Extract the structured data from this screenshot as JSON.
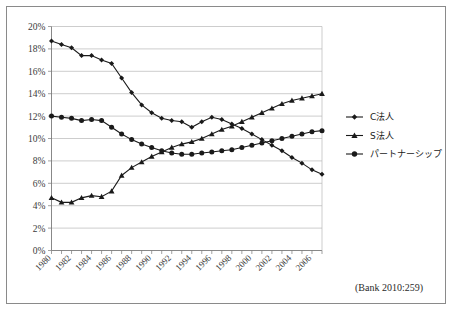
{
  "figure": {
    "source_note": "(Bank 2010:259)"
  },
  "chart_data": {
    "type": "line",
    "title": "",
    "xlabel": "",
    "ylabel": "",
    "grid": true,
    "legend_position": "right",
    "ylim": [
      0,
      20
    ],
    "yunit": "%",
    "ytick_labels": [
      "0%",
      "2%",
      "4%",
      "6%",
      "8%",
      "10%",
      "12%",
      "14%",
      "16%",
      "18%",
      "20%"
    ],
    "ytick_values": [
      0,
      2,
      4,
      6,
      8,
      10,
      12,
      14,
      16,
      18,
      20
    ],
    "x": [
      1980,
      1981,
      1982,
      1983,
      1984,
      1985,
      1986,
      1987,
      1988,
      1989,
      1990,
      1991,
      1992,
      1993,
      1994,
      1995,
      1996,
      1997,
      1998,
      1999,
      2000,
      2001,
      2002,
      2003,
      2004,
      2005,
      2006,
      2007
    ],
    "xtick_labels": [
      "1980",
      "1982",
      "1984",
      "1986",
      "1988",
      "1990",
      "1992",
      "1994",
      "1996",
      "1998",
      "2000",
      "2002",
      "2004",
      "2006"
    ],
    "xtick_values": [
      1980,
      1982,
      1984,
      1986,
      1988,
      1990,
      1992,
      1994,
      1996,
      1998,
      2000,
      2002,
      2004,
      2006
    ],
    "series": [
      {
        "name": "C法人",
        "marker": "diamond",
        "color": "#1a1a1a",
        "values": [
          18.7,
          18.4,
          18.1,
          17.4,
          17.4,
          17.0,
          16.7,
          15.4,
          14.1,
          13.0,
          12.3,
          11.8,
          11.6,
          11.5,
          11.0,
          11.5,
          11.9,
          11.7,
          11.3,
          10.9,
          10.4,
          9.9,
          9.4,
          8.9,
          8.3,
          7.8,
          7.2,
          6.8
        ]
      },
      {
        "name": "S法人",
        "marker": "triangle",
        "color": "#1a1a1a",
        "values": [
          4.7,
          4.3,
          4.3,
          4.7,
          4.9,
          4.8,
          5.3,
          6.7,
          7.4,
          7.9,
          8.4,
          8.8,
          9.2,
          9.5,
          9.7,
          10.0,
          10.4,
          10.8,
          11.1,
          11.5,
          11.9,
          12.3,
          12.7,
          13.1,
          13.4,
          13.6,
          13.8,
          14.0
        ]
      },
      {
        "name": "パートナーシップ",
        "marker": "circle",
        "color": "#1a1a1a",
        "values": [
          12.0,
          11.9,
          11.8,
          11.6,
          11.7,
          11.6,
          11.0,
          10.4,
          9.9,
          9.5,
          9.2,
          8.9,
          8.7,
          8.6,
          8.6,
          8.7,
          8.8,
          8.9,
          9.0,
          9.2,
          9.4,
          9.6,
          9.8,
          10.0,
          10.2,
          10.4,
          10.6,
          10.7
        ]
      }
    ]
  },
  "legend": {
    "items": [
      {
        "label": "C法人",
        "marker": "diamond"
      },
      {
        "label": "S法人",
        "marker": "triangle"
      },
      {
        "label": "パートナーシップ",
        "marker": "circle"
      }
    ]
  }
}
